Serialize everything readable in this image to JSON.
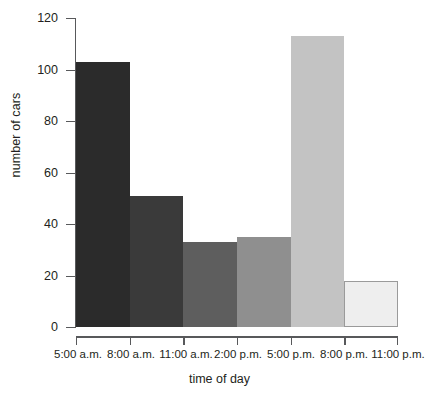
{
  "chart_data": {
    "type": "bar",
    "title": "",
    "subtitle": "",
    "xlabel": "time of day",
    "ylabel": "number of cars",
    "categories": [
      "5:00 a.m.–8:00 a.m.",
      "8:00 a.m.–11:00 a.m.",
      "11:00 a.m.–2:00 p.m.",
      "2:00 p.m.–5:00 p.m.",
      "5:00 p.m.–8:00 p.m.",
      "8:00 p.m.–11:00 p.m."
    ],
    "values": [
      103,
      51,
      33,
      35,
      113,
      18
    ],
    "bin_edges": [
      "5:00 a.m.",
      "8:00 a.m.",
      "11:00 a.m.",
      "2:00 p.m.",
      "5:00 p.m.",
      "8:00 p.m.",
      "11:00 p.m."
    ],
    "x_tick_labels": [
      "5:00 a.m.",
      "8:00 a.m.",
      "11:00 a.m.",
      "2:00 p.m.",
      "5:00 p.m.",
      "8:00 p.m.",
      "11:00 p.m."
    ],
    "y_tick_labels": [
      "0",
      "20",
      "40",
      "60",
      "80",
      "100",
      "120"
    ],
    "y_tick_values": [
      0,
      20,
      40,
      60,
      80,
      100,
      120
    ],
    "ylim": [
      0,
      120
    ],
    "grid": false,
    "legend": "none",
    "bar_colors": [
      "#2b2b2b",
      "#3a3a3a",
      "#5e5e5e",
      "#8f8f8f",
      "#c3c3c3",
      "#eeeeee"
    ],
    "axis_color": "#58595b",
    "text_color": "#231f20",
    "background": "#ffffff"
  }
}
